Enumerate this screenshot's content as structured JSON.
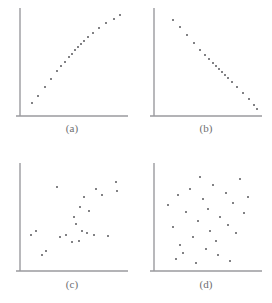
{
  "figure": {
    "background_color": "#ffffff",
    "axis_color": "#9a9a9e",
    "point_color": "#58585c",
    "caption_color": "#6d6d70",
    "point_radius_px": 1
  },
  "chart_data": [
    {
      "type": "scatter",
      "panel_label": "(a)",
      "title": "",
      "xlabel": "",
      "ylabel": "",
      "xlim": [
        0,
        100
      ],
      "ylim": [
        0,
        100
      ],
      "grid": false,
      "legend": "none",
      "axes": [
        "left",
        "bottom"
      ],
      "description": "perfect positive linear relationship",
      "n_points": 19,
      "x": [
        8,
        14,
        21,
        27,
        33,
        37,
        41,
        45,
        48,
        51,
        54,
        57,
        60,
        64,
        69,
        75,
        82,
        90,
        96
      ],
      "y": [
        9,
        16,
        25,
        33,
        41,
        46,
        50,
        55,
        58,
        62,
        65,
        68,
        71,
        75,
        79,
        84,
        89,
        93,
        97
      ]
    },
    {
      "type": "scatter",
      "panel_label": "(b)",
      "title": "",
      "xlabel": "",
      "ylabel": "",
      "xlim": [
        0,
        100
      ],
      "ylim": [
        0,
        100
      ],
      "grid": false,
      "legend": "none",
      "axes": [
        "left",
        "bottom"
      ],
      "description": "perfect negative linear relationship",
      "n_points": 19,
      "x": [
        15,
        22,
        29,
        36,
        42,
        47,
        51,
        55,
        58,
        61,
        64,
        67,
        70,
        74,
        79,
        85,
        91,
        96,
        99
      ],
      "y": [
        92,
        85,
        77,
        69,
        62,
        57,
        53,
        49,
        46,
        43,
        40,
        37,
        34,
        30,
        25,
        19,
        13,
        7,
        3
      ]
    },
    {
      "type": "scatter",
      "panel_label": "(c)",
      "title": "",
      "xlabel": "",
      "ylabel": "",
      "xlim": [
        0,
        100
      ],
      "ylim": [
        0,
        100
      ],
      "grid": false,
      "legend": "none",
      "axes": [
        "left",
        "bottom"
      ],
      "description": "moderate positive correlation with scatter",
      "n_points": 22,
      "x": [
        7,
        12,
        18,
        22,
        33,
        36,
        42,
        48,
        50,
        52,
        55,
        56,
        58,
        60,
        63,
        65,
        70,
        72,
        78,
        84,
        92,
        93
      ],
      "y": [
        32,
        36,
        12,
        16,
        80,
        30,
        32,
        25,
        50,
        43,
        26,
        60,
        36,
        70,
        34,
        56,
        32,
        78,
        72,
        31,
        85,
        76
      ]
    },
    {
      "type": "scatter",
      "panel_label": "(d)",
      "title": "",
      "xlabel": "",
      "ylabel": "",
      "xlim": [
        0,
        100
      ],
      "ylim": [
        0,
        100
      ],
      "grid": false,
      "legend": "none",
      "axes": [
        "left",
        "bottom"
      ],
      "description": "no correlation, uniform random scatter",
      "n_points": 28,
      "x": [
        10,
        15,
        18,
        20,
        22,
        25,
        28,
        32,
        35,
        38,
        40,
        42,
        45,
        48,
        50,
        52,
        55,
        58,
        60,
        62,
        68,
        70,
        72,
        75,
        78,
        82,
        86,
        90
      ],
      "y": [
        62,
        40,
        8,
        72,
        22,
        14,
        55,
        78,
        30,
        4,
        46,
        90,
        68,
        18,
        58,
        36,
        82,
        26,
        12,
        50,
        74,
        42,
        6,
        64,
        34,
        88,
        54,
        70
      ]
    }
  ],
  "captions": {
    "a": "(a)",
    "b": "(b)",
    "c": "(c)",
    "d": "(d)"
  }
}
